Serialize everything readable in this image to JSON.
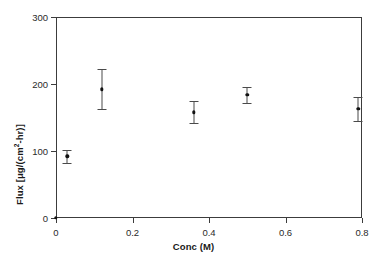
{
  "chart_data": {
    "type": "scatter",
    "title": "",
    "xlabel": "Conc (M)",
    "ylabel": "Flux [μg/(cm²-hr)]",
    "ylabel_parts": {
      "prefix": "Flux [",
      "mu": "μ",
      "mid": "g/(cm",
      "exponent": "2",
      "suffix": "-hr)]"
    },
    "xlim": [
      0,
      0.8
    ],
    "ylim": [
      0,
      300
    ],
    "xticks": [
      0,
      0.2,
      0.4,
      0.6,
      0.8
    ],
    "xtick_labels": [
      "0",
      "0.2",
      "0.4",
      "0.6",
      "0.8"
    ],
    "yticks": [
      0,
      100,
      200,
      300
    ],
    "ytick_labels": [
      "0",
      "100",
      "200",
      "300"
    ],
    "grid": false,
    "legend": false,
    "marker": "filled-circle",
    "marker_color": "#111111",
    "errorbar_color": "#4a4a4a",
    "frame_color": "#3c3c3c",
    "x": [
      0,
      0.03,
      0.12,
      0.36,
      0.5,
      0.79
    ],
    "y": [
      0,
      92,
      192,
      158,
      184,
      163
    ],
    "yerr": [
      0,
      10,
      30,
      16,
      12,
      18
    ],
    "points": [
      {
        "x": 0,
        "y": 0,
        "yerr": 0,
        "ylow": 0,
        "yhigh": 0
      },
      {
        "x": 0.03,
        "y": 92,
        "yerr": 10,
        "ylow": 82,
        "yhigh": 102
      },
      {
        "x": 0.12,
        "y": 192,
        "yerr": 30,
        "ylow": 162,
        "yhigh": 222
      },
      {
        "x": 0.36,
        "y": 158,
        "yerr": 16,
        "ylow": 142,
        "yhigh": 174
      },
      {
        "x": 0.5,
        "y": 184,
        "yerr": 12,
        "ylow": 172,
        "yhigh": 196
      },
      {
        "x": 0.79,
        "y": 163,
        "yerr": 18,
        "ylow": 145,
        "yhigh": 181
      }
    ]
  },
  "layout": {
    "plot_left": 56,
    "plot_top": 17,
    "plot_right": 362,
    "plot_bottom": 218
  }
}
